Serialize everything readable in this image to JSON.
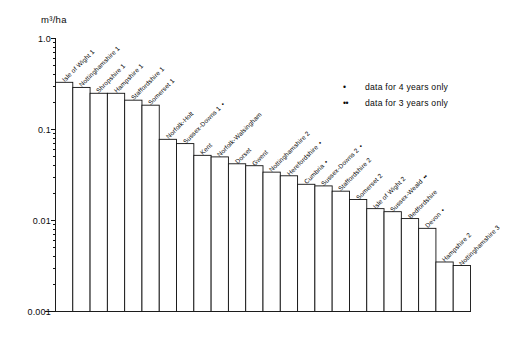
{
  "chart_data": {
    "type": "bar",
    "title": "",
    "ylabel": "m³/ha",
    "xlabel": "",
    "yscale": "log",
    "ylim": [
      0.001,
      1.0
    ],
    "ytick_labels": [
      "1.0",
      "0.1",
      "0.01",
      "0.001"
    ],
    "ytick_values": [
      1.0,
      0.1,
      0.01,
      0.001
    ],
    "grid": false,
    "categories": [
      "Isle of Wight 1",
      "Nottinghamshire 1",
      "Shropshire 1",
      "Hampshire 1",
      "Staffordshire 1",
      "Somerset 1",
      "Norfolk-Holt",
      "Sussex-Downs 1",
      "Kent",
      "Norfolk-Walsingham",
      "Dorset",
      "Gwent",
      "Nottinghamshire 2",
      "Herefordshire",
      "Cumbria",
      "Sussex-Downs 2",
      "Staffordshire 2",
      "Somerset 2",
      "Isle of Wight 2",
      "Sussex-Weald",
      "Bedfordshire",
      "Devon",
      "Hampshire 2",
      "Nottinghamshire 3"
    ],
    "category_marks": [
      "",
      "",
      "",
      "",
      "",
      "",
      "",
      "*",
      "",
      "",
      "",
      "",
      "",
      "*",
      "*",
      "*",
      "",
      "",
      "",
      "**",
      "",
      "*",
      "",
      ""
    ],
    "values": [
      0.33,
      0.29,
      0.25,
      0.25,
      0.21,
      0.185,
      0.078,
      0.07,
      0.052,
      0.05,
      0.042,
      0.04,
      0.034,
      0.031,
      0.025,
      0.024,
      0.021,
      0.017,
      0.0135,
      0.0125,
      0.0105,
      0.0082,
      0.0035,
      0.0032
    ],
    "legend_position": "upper-right",
    "legend": [
      {
        "mark": "•",
        "label": "data for 4 years only"
      },
      {
        "mark": "••",
        "label": "data for 3 years only"
      }
    ]
  },
  "axis": {
    "y_title": "m³/ha"
  }
}
